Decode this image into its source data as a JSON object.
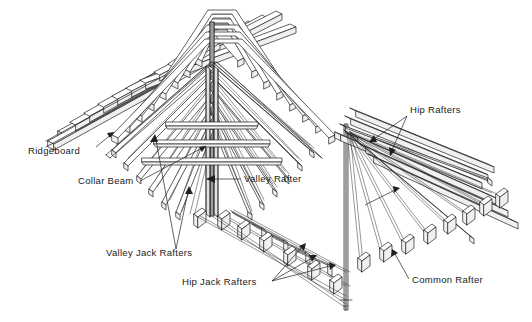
{
  "figure": {
    "background_color": "#ffffff",
    "line_color": "#202020",
    "text_color": "#1a1a1a",
    "width": 532,
    "height": 322
  },
  "labels": [
    {
      "id": "ridgeboard",
      "text": "Ridgeboard",
      "x": 28,
      "y": 154,
      "anchor": "start"
    },
    {
      "id": "collar-beam",
      "text": "Collar Beam",
      "x": 78,
      "y": 184,
      "anchor": "start"
    },
    {
      "id": "valley-rafter",
      "text": "Valley Rafter",
      "x": 244,
      "y": 182,
      "anchor": "start"
    },
    {
      "id": "valley-jack-rafters",
      "text": "Valley Jack Rafters",
      "x": 106,
      "y": 256,
      "anchor": "start"
    },
    {
      "id": "hip-jack-rafters",
      "text": "Hip Jack Rafters",
      "x": 182,
      "y": 285,
      "anchor": "start"
    },
    {
      "id": "hip-rafters",
      "text": "Hip Rafters",
      "x": 410,
      "y": 113,
      "anchor": "start"
    },
    {
      "id": "common-rafter",
      "text": "Common Rafter",
      "x": 412,
      "y": 283,
      "anchor": "start"
    }
  ]
}
